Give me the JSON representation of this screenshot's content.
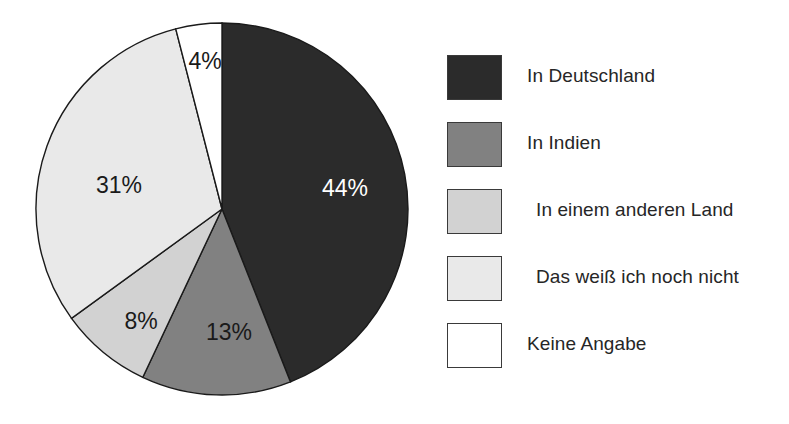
{
  "chart_data": {
    "type": "pie",
    "title": "",
    "subtitle": "",
    "xlabel": "",
    "ylabel": "",
    "grid": false,
    "legend_position": "right",
    "start_angle_deg": 0,
    "direction": "clockwise",
    "categories": [
      "In Deutschland",
      "In Indien",
      "In einem anderen Land",
      "Das weiß ich noch nicht",
      "Keine Angabe"
    ],
    "values": [
      44,
      13,
      8,
      31,
      4
    ],
    "value_labels": [
      "44%",
      "13%",
      "8%",
      "31%",
      "4%"
    ],
    "colors": [
      "#2b2b2b",
      "#818181",
      "#d2d2d2",
      "#e9e9e9",
      "#ffffff"
    ],
    "label_text_colors": [
      "#ffffff",
      "#1a1a1a",
      "#1a1a1a",
      "#1a1a1a",
      "#1a1a1a"
    ],
    "slices": [
      {
        "label": "In Deutschland",
        "value": 44,
        "display": "44%",
        "color": "#2b2b2b",
        "text_color": "#ffffff",
        "label_x": 345,
        "label_y": 190
      },
      {
        "label": "In Indien",
        "value": 13,
        "display": "13%",
        "color": "#818181",
        "text_color": "#1a1a1a",
        "label_x": 229,
        "label_y": 334
      },
      {
        "label": "In einem anderen Land",
        "value": 8,
        "display": "8%",
        "color": "#d2d2d2",
        "text_color": "#1a1a1a",
        "label_x": 141,
        "label_y": 323
      },
      {
        "label": "Das weiß ich noch nicht",
        "value": 31,
        "display": "31%",
        "color": "#e9e9e9",
        "text_color": "#1a1a1a",
        "label_x": 119,
        "label_y": 187
      },
      {
        "label": "Keine Angabe",
        "value": 4,
        "display": "4%",
        "color": "#ffffff",
        "text_color": "#1a1a1a",
        "label_x": 205,
        "label_y": 63
      }
    ],
    "total": 100,
    "units": "percent",
    "geometry": {
      "center_x": 222,
      "center_y": 209,
      "radius": 186
    }
  },
  "legend": {
    "items": [
      {
        "label": "In Deutschland",
        "color": "#2b2b2b",
        "swatch": "legend-swatch-in-deutschland"
      },
      {
        "label": "In Indien",
        "color": "#818181",
        "swatch": "legend-swatch-in-indien"
      },
      {
        "label": "In einem anderen Land",
        "color": "#d2d2d2",
        "swatch": "legend-swatch-in-einem-anderen-land"
      },
      {
        "label": "Das weiß ich noch nicht",
        "color": "#e9e9e9",
        "swatch": "legend-swatch-das-weiss-ich-noch-nicht"
      },
      {
        "label": "Keine Angabe",
        "color": "#ffffff",
        "swatch": "legend-swatch-keine-angabe"
      }
    ]
  }
}
